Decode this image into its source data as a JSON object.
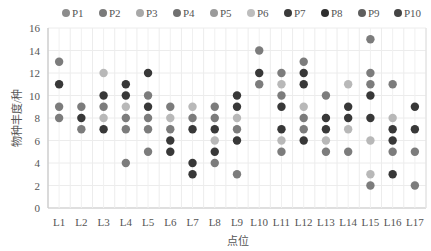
{
  "chart_data": {
    "type": "scatter",
    "title": "",
    "xlabel": "点位",
    "ylabel": "物种丰度/种",
    "ylim": [
      0,
      16
    ],
    "yticks": [
      0,
      2,
      4,
      6,
      8,
      10,
      12,
      14,
      16
    ],
    "grid": true,
    "legend_position": "top",
    "categories": [
      "L1",
      "L2",
      "L3",
      "L4",
      "L5",
      "L6",
      "L7",
      "L8",
      "L9",
      "L10",
      "L11",
      "L12",
      "L13",
      "L14",
      "L15",
      "L16",
      "L17"
    ],
    "legend": [
      {
        "name": "P1",
        "color": "#8c8c8c"
      },
      {
        "name": "P2",
        "color": "#7a7a7a"
      },
      {
        "name": "P3",
        "color": "#a8a8a8"
      },
      {
        "name": "P4",
        "color": "#707070"
      },
      {
        "name": "P5",
        "color": "#9a9a9a"
      },
      {
        "name": "P6",
        "color": "#bdbdbd"
      },
      {
        "name": "P7",
        "color": "#3a3a3a"
      },
      {
        "name": "P8",
        "color": "#2e2e2e"
      },
      {
        "name": "P9",
        "color": "#5e5e5e"
      },
      {
        "name": "P10",
        "color": "#444444"
      }
    ],
    "points": [
      {
        "x": "L1",
        "values": [
          {
            "y": 13,
            "shade": "mid"
          },
          {
            "y": 11,
            "shade": "dark"
          },
          {
            "y": 9,
            "shade": "mid"
          },
          {
            "y": 8,
            "shade": "mid"
          }
        ]
      },
      {
        "x": "L2",
        "values": [
          {
            "y": 9,
            "shade": "mid"
          },
          {
            "y": 8,
            "shade": "dark"
          },
          {
            "y": 7,
            "shade": "mid"
          }
        ]
      },
      {
        "x": "L3",
        "values": [
          {
            "y": 12,
            "shade": "light"
          },
          {
            "y": 10,
            "shade": "dark"
          },
          {
            "y": 9,
            "shade": "mid"
          },
          {
            "y": 8,
            "shade": "light"
          },
          {
            "y": 7,
            "shade": "dark"
          }
        ]
      },
      {
        "x": "L4",
        "values": [
          {
            "y": 11,
            "shade": "dark"
          },
          {
            "y": 10,
            "shade": "dark"
          },
          {
            "y": 9,
            "shade": "light"
          },
          {
            "y": 8,
            "shade": "mid"
          },
          {
            "y": 7,
            "shade": "mid"
          },
          {
            "y": 4,
            "shade": "mid"
          }
        ]
      },
      {
        "x": "L5",
        "values": [
          {
            "y": 12,
            "shade": "dark"
          },
          {
            "y": 10,
            "shade": "mid"
          },
          {
            "y": 9,
            "shade": "dark"
          },
          {
            "y": 8,
            "shade": "mid"
          },
          {
            "y": 7,
            "shade": "mid"
          },
          {
            "y": 5,
            "shade": "mid"
          }
        ]
      },
      {
        "x": "L6",
        "values": [
          {
            "y": 9,
            "shade": "mid"
          },
          {
            "y": 8,
            "shade": "light"
          },
          {
            "y": 7,
            "shade": "mid"
          },
          {
            "y": 6,
            "shade": "dark"
          },
          {
            "y": 5,
            "shade": "dark"
          }
        ]
      },
      {
        "x": "L7",
        "values": [
          {
            "y": 9,
            "shade": "light"
          },
          {
            "y": 8,
            "shade": "mid"
          },
          {
            "y": 7,
            "shade": "dark"
          },
          {
            "y": 4,
            "shade": "dark"
          },
          {
            "y": 3,
            "shade": "dark"
          }
        ]
      },
      {
        "x": "L8",
        "values": [
          {
            "y": 9,
            "shade": "mid"
          },
          {
            "y": 8,
            "shade": "mid"
          },
          {
            "y": 7,
            "shade": "dark"
          },
          {
            "y": 6,
            "shade": "light"
          },
          {
            "y": 5,
            "shade": "dark"
          },
          {
            "y": 4,
            "shade": "mid"
          }
        ]
      },
      {
        "x": "L9",
        "values": [
          {
            "y": 10,
            "shade": "dark"
          },
          {
            "y": 9,
            "shade": "dark"
          },
          {
            "y": 8,
            "shade": "light"
          },
          {
            "y": 7,
            "shade": "mid"
          },
          {
            "y": 6,
            "shade": "dark"
          },
          {
            "y": 3,
            "shade": "mid"
          }
        ]
      },
      {
        "x": "L10",
        "values": [
          {
            "y": 14,
            "shade": "mid"
          },
          {
            "y": 12,
            "shade": "dark"
          },
          {
            "y": 11,
            "shade": "mid"
          }
        ]
      },
      {
        "x": "L11",
        "values": [
          {
            "y": 12,
            "shade": "mid"
          },
          {
            "y": 11,
            "shade": "light"
          },
          {
            "y": 10,
            "shade": "mid"
          },
          {
            "y": 9,
            "shade": "dark"
          },
          {
            "y": 7,
            "shade": "dark"
          },
          {
            "y": 6,
            "shade": "light"
          },
          {
            "y": 5,
            "shade": "mid"
          }
        ]
      },
      {
        "x": "L12",
        "values": [
          {
            "y": 13,
            "shade": "mid"
          },
          {
            "y": 12,
            "shade": "dark"
          },
          {
            "y": 11,
            "shade": "dark"
          },
          {
            "y": 9,
            "shade": "light"
          },
          {
            "y": 8,
            "shade": "mid"
          },
          {
            "y": 7,
            "shade": "mid"
          },
          {
            "y": 6,
            "shade": "dark"
          }
        ]
      },
      {
        "x": "L13",
        "values": [
          {
            "y": 10,
            "shade": "mid"
          },
          {
            "y": 8,
            "shade": "dark"
          },
          {
            "y": 7,
            "shade": "dark"
          },
          {
            "y": 6,
            "shade": "light"
          },
          {
            "y": 5,
            "shade": "mid"
          }
        ]
      },
      {
        "x": "L14",
        "values": [
          {
            "y": 11,
            "shade": "light"
          },
          {
            "y": 9,
            "shade": "dark"
          },
          {
            "y": 8,
            "shade": "dark"
          },
          {
            "y": 7,
            "shade": "light"
          },
          {
            "y": 5,
            "shade": "mid"
          }
        ]
      },
      {
        "x": "L15",
        "values": [
          {
            "y": 15,
            "shade": "mid"
          },
          {
            "y": 12,
            "shade": "mid"
          },
          {
            "y": 11,
            "shade": "mid"
          },
          {
            "y": 10,
            "shade": "dark"
          },
          {
            "y": 8,
            "shade": "dark"
          },
          {
            "y": 6,
            "shade": "light"
          },
          {
            "y": 3,
            "shade": "light"
          },
          {
            "y": 2,
            "shade": "mid"
          }
        ]
      },
      {
        "x": "L16",
        "values": [
          {
            "y": 11,
            "shade": "mid"
          },
          {
            "y": 8,
            "shade": "light"
          },
          {
            "y": 7,
            "shade": "dark"
          },
          {
            "y": 6,
            "shade": "dark"
          },
          {
            "y": 5,
            "shade": "mid"
          },
          {
            "y": 3,
            "shade": "dark"
          }
        ]
      },
      {
        "x": "L17",
        "values": [
          {
            "y": 9,
            "shade": "dark"
          },
          {
            "y": 7,
            "shade": "dark"
          },
          {
            "y": 5,
            "shade": "mid"
          },
          {
            "y": 2,
            "shade": "mid"
          }
        ]
      }
    ],
    "shade_colors": {
      "light": "#b8b8b8",
      "mid": "#7c7c7c",
      "dark": "#383838"
    }
  }
}
